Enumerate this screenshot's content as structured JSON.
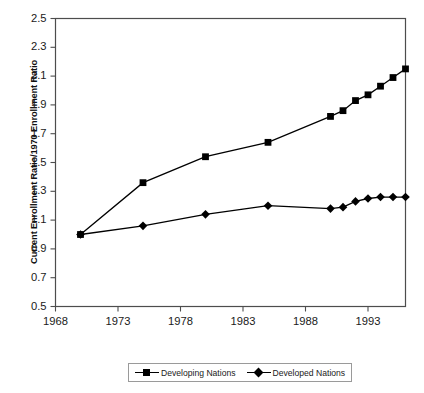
{
  "chart_data": {
    "type": "line",
    "title": "",
    "xlabel": "",
    "ylabel": "Current Enrollment Ratio/1970 Enrollment Ratio",
    "xlim": [
      1968,
      1996
    ],
    "ylim": [
      0.5,
      2.5
    ],
    "xticks": [
      1968,
      1973,
      1978,
      1983,
      1988,
      1993
    ],
    "yticks": [
      0.5,
      0.7,
      0.9,
      1.1,
      1.3,
      1.5,
      1.7,
      1.9,
      2.1,
      2.3,
      2.5
    ],
    "grid": false,
    "legend_position": "bottom",
    "series": [
      {
        "name": "Developing Nations",
        "marker": "square",
        "color": "#000000",
        "x": [
          1970,
          1975,
          1980,
          1985,
          1990,
          1991,
          1992,
          1993,
          1994,
          1995,
          1996
        ],
        "values": [
          1.0,
          1.36,
          1.54,
          1.64,
          1.82,
          1.86,
          1.93,
          1.97,
          2.03,
          2.09,
          2.15
        ]
      },
      {
        "name": "Developed Nations",
        "marker": "diamond",
        "color": "#000000",
        "x": [
          1970,
          1975,
          1980,
          1985,
          1990,
          1991,
          1992,
          1993,
          1994,
          1995,
          1996
        ],
        "values": [
          1.0,
          1.06,
          1.14,
          1.2,
          1.18,
          1.19,
          1.23,
          1.25,
          1.26,
          1.26,
          1.26
        ]
      }
    ]
  },
  "axes": {
    "y_title": "Current Enrollment Ratio/1970 Enrollment Ratio",
    "y_tick_labels": [
      "2.5",
      "2.3",
      "2.1",
      "1.9",
      "1.7",
      "1.5",
      "1.3",
      "1.1",
      "0.9",
      "0.7",
      "0.5"
    ],
    "x_tick_labels": [
      "1968",
      "1973",
      "1978",
      "1983",
      "1988",
      "1993"
    ]
  },
  "legend": {
    "items": [
      {
        "label": "Developing Nations",
        "marker": "square"
      },
      {
        "label": "Developed Nations",
        "marker": "diamond"
      }
    ]
  }
}
